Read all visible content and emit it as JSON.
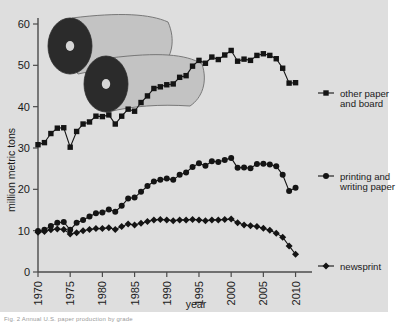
{
  "figure": {
    "caption": "Fig. 2   Annual U.S. paper production by grade",
    "background_color": "#dedede",
    "ink_color": "#141414"
  },
  "decoration": {
    "name": "paper-roll-illustration",
    "description": "two rolls of paper unwinding"
  },
  "legend": [
    {
      "id": "other-paper-and-board",
      "marker": "square",
      "label_line1": "other paper",
      "label_line2": "and board"
    },
    {
      "id": "printing-and-writing-paper",
      "marker": "circle",
      "label_line1": "printing and",
      "label_line2": "writing paper"
    },
    {
      "id": "newsprint",
      "marker": "diamond",
      "label_line1": "newsprint",
      "label_line2": ""
    }
  ],
  "chart_data": {
    "type": "line",
    "title": "",
    "xlabel": "year",
    "ylabel": "million metric tons",
    "xlim": [
      1970,
      2011
    ],
    "ylim": [
      0,
      60
    ],
    "xticks": [
      1970,
      1975,
      1980,
      1985,
      1990,
      1995,
      2000,
      2005,
      2010
    ],
    "yticks": [
      0,
      10,
      20,
      30,
      40,
      50,
      60
    ],
    "grid": false,
    "legend_position": "right",
    "x": [
      1970,
      1971,
      1972,
      1973,
      1974,
      1975,
      1976,
      1977,
      1978,
      1979,
      1980,
      1981,
      1982,
      1983,
      1984,
      1985,
      1986,
      1987,
      1988,
      1989,
      1990,
      1991,
      1992,
      1993,
      1994,
      1995,
      1996,
      1997,
      1998,
      1999,
      2000,
      2001,
      2002,
      2003,
      2004,
      2005,
      2006,
      2007,
      2008,
      2009,
      2010
    ],
    "series": [
      {
        "name": "other paper and board",
        "marker": "square",
        "values": [
          30.8,
          31.3,
          33.5,
          34.8,
          34.9,
          30.2,
          34.0,
          35.8,
          36.3,
          37.7,
          37.6,
          38.0,
          35.8,
          37.7,
          39.4,
          38.9,
          41.0,
          42.6,
          44.4,
          44.8,
          45.3,
          45.5,
          47.1,
          47.5,
          49.8,
          51.2,
          50.5,
          52.0,
          51.4,
          52.5,
          53.6,
          51.0,
          51.5,
          51.2,
          52.4,
          52.8,
          52.4,
          51.6,
          49.3,
          45.7,
          45.8
        ]
      },
      {
        "name": "printing and writing paper",
        "marker": "circle",
        "values": [
          9.9,
          10.2,
          11.1,
          11.9,
          12.1,
          10.2,
          11.9,
          12.6,
          13.4,
          14.2,
          14.4,
          15.1,
          14.6,
          16.0,
          17.8,
          18.0,
          19.4,
          20.8,
          21.9,
          22.3,
          22.6,
          22.3,
          23.5,
          24.1,
          25.4,
          26.3,
          25.7,
          26.8,
          26.6,
          27.1,
          27.6,
          25.2,
          25.3,
          25.1,
          26.1,
          26.2,
          26.0,
          25.6,
          23.5,
          19.6,
          20.4
        ]
      },
      {
        "name": "newsprint",
        "marker": "diamond",
        "values": [
          9.6,
          9.8,
          10.2,
          10.4,
          10.3,
          9.2,
          9.5,
          10.0,
          10.3,
          10.5,
          10.5,
          10.7,
          10.3,
          11.0,
          11.6,
          11.4,
          11.8,
          12.2,
          12.6,
          12.7,
          12.6,
          12.4,
          12.6,
          12.6,
          12.7,
          12.6,
          12.4,
          12.6,
          12.6,
          12.7,
          12.8,
          11.9,
          11.4,
          11.2,
          11.0,
          10.6,
          10.1,
          9.4,
          8.4,
          6.3,
          4.3
        ]
      }
    ]
  }
}
